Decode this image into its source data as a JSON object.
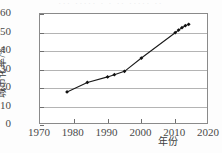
{
  "top_strip_text": "··· ····· · · ·· ····· ··",
  "chart_data": {
    "type": "line",
    "title": "",
    "subtitle": "",
    "xlabel": "年份",
    "ylabel": "城市化率/%",
    "xlim": [
      1970,
      2020
    ],
    "ylim": [
      0,
      60
    ],
    "xticks": [
      1970,
      1980,
      1990,
      2000,
      2010,
      2020
    ],
    "xtick_labels": [
      "1970",
      "1980",
      "1990",
      "2000",
      "2010",
      "2020"
    ],
    "yticks": [
      0,
      10,
      20,
      30,
      40,
      50,
      60
    ],
    "ytick_labels": [
      "0",
      "10",
      "20",
      "30",
      "40",
      "50",
      "60"
    ],
    "grid": "horizontal",
    "legend": "none",
    "marker": "filled-diamond",
    "line_color": "#1a1a1a",
    "marker_color": "#111111",
    "grid_color": "#b4b4b4",
    "frame_color": "#8a8a8a",
    "x": [
      1978,
      1984,
      1990,
      1992,
      1995,
      2000,
      2010,
      2011,
      2012,
      2013,
      2014
    ],
    "values": [
      17.9,
      23.0,
      26.0,
      27.2,
      29.0,
      36.2,
      49.9,
      51.3,
      52.6,
      53.7,
      54.4
    ],
    "series": [
      {
        "name": "城市化率",
        "points": [
          {
            "x": 1978,
            "y": 17.9
          },
          {
            "x": 1984,
            "y": 23.0
          },
          {
            "x": 1990,
            "y": 26.0
          },
          {
            "x": 1992,
            "y": 27.2
          },
          {
            "x": 1995,
            "y": 29.0
          },
          {
            "x": 2000,
            "y": 36.2
          },
          {
            "x": 2010,
            "y": 49.9
          },
          {
            "x": 2011,
            "y": 51.3
          },
          {
            "x": 2012,
            "y": 52.6
          },
          {
            "x": 2013,
            "y": 53.7
          },
          {
            "x": 2014,
            "y": 54.4
          }
        ]
      }
    ]
  }
}
